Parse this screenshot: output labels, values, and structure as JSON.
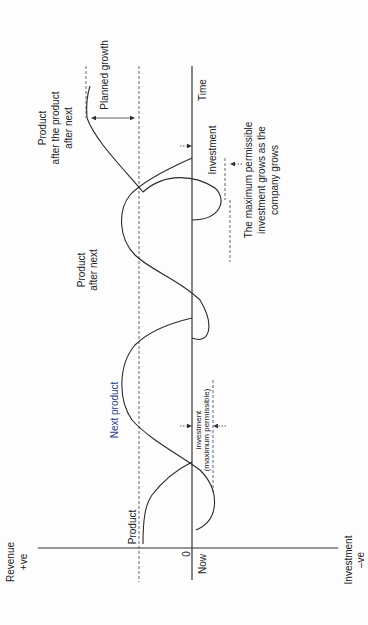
{
  "diagram": {
    "orientation": "rotated 90 degrees counter-clockwise",
    "axes": {
      "revenue_label": "Revenue",
      "revenue_sign": "+ve",
      "investment_label": "Investment",
      "investment_sign": "–ve",
      "origin_label": "0",
      "now_label": "Now",
      "time_label": "Time"
    },
    "curves": [
      {
        "label": "Product"
      },
      {
        "label": "Next product"
      },
      {
        "label_line1": "Product",
        "label_line2": "after next"
      },
      {
        "label_line1": "Product",
        "label_line2": "after the product",
        "label_line3": "after next"
      }
    ],
    "annotations": {
      "planned_growth": "Planned growth",
      "investment": "Investment",
      "investment_max_line1": "investment",
      "investment_max_line2": "(maximum permissible)",
      "note_line1": "The maximum permissible",
      "note_line2": "investment grows as the",
      "note_line3": "company grows"
    }
  }
}
